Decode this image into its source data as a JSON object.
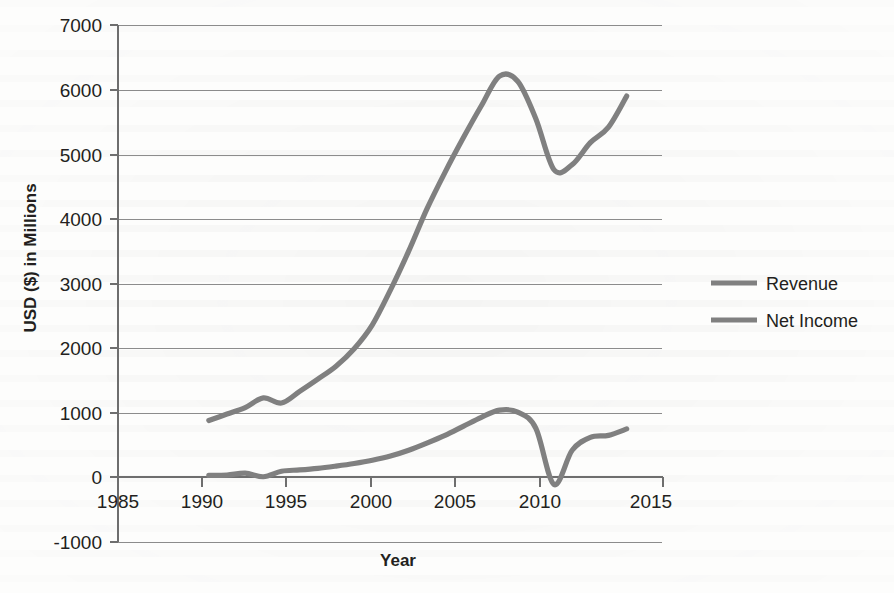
{
  "chart_data": {
    "type": "line",
    "title": "",
    "xlabel": "Year",
    "ylabel": "USD ($) in Millions",
    "xlim": [
      1985,
      2015
    ],
    "ylim": [
      -1000,
      7000
    ],
    "grid": true,
    "legend_position": "right",
    "x_ticks": [
      "1985",
      "1990",
      "1995",
      "2000",
      "2005",
      "2010",
      "2015"
    ],
    "y_ticks": [
      "7000",
      "6000",
      "5000",
      "4000",
      "3000",
      "2000",
      "1000",
      "0",
      "-1000"
    ],
    "x": [
      1990,
      1991,
      1992,
      1993,
      1994,
      1995,
      1996,
      1997,
      1998,
      1999,
      2000,
      2001,
      2002,
      2003,
      2004,
      2005,
      2006,
      2007,
      2008,
      2009,
      2010,
      2011,
      2012,
      2013
    ],
    "series": [
      {
        "name": "Revenue",
        "color": "#808080",
        "values": [
          880,
          980,
          1080,
          1230,
          1150,
          1330,
          1520,
          1720,
          1990,
          2360,
          2900,
          3500,
          4150,
          4720,
          5250,
          5750,
          6210,
          6130,
          5550,
          4760,
          4840,
          5180,
          5420,
          5900
        ]
      },
      {
        "name": "Net Income",
        "color": "#808080",
        "values": [
          30,
          35,
          65,
          10,
          95,
          115,
          140,
          175,
          215,
          265,
          330,
          420,
          530,
          650,
          790,
          930,
          1040,
          1010,
          760,
          -110,
          420,
          620,
          650,
          750
        ]
      }
    ]
  },
  "legend": {
    "entries": [
      {
        "label": "Revenue"
      },
      {
        "label": "Net Income"
      }
    ]
  },
  "axes": {
    "y_title": "USD ($) in Millions",
    "x_title": "Year"
  }
}
